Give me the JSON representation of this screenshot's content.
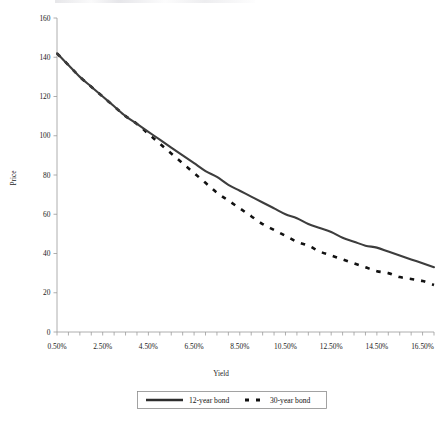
{
  "chart_data": {
    "type": "line",
    "title": "",
    "xlabel": "Yield",
    "ylabel": "Price",
    "xlim": [
      0.5,
      17.0
    ],
    "ylim": [
      0,
      160
    ],
    "grid": false,
    "legend_position": "bottom",
    "x_tick_labels": [
      "0.50%",
      "2.50%",
      "4.50%",
      "6.50%",
      "8.50%",
      "10.50%",
      "12.50%",
      "14.50%",
      "16.50%"
    ],
    "x_tick_values": [
      0.5,
      2.5,
      4.5,
      6.5,
      8.5,
      10.5,
      12.5,
      14.5,
      16.5
    ],
    "x_minor_tick_step": 0.5,
    "y_tick_labels": [
      "0",
      "20",
      "40",
      "60",
      "80",
      "100",
      "120",
      "140",
      "160"
    ],
    "y_tick_values": [
      0,
      20,
      40,
      60,
      80,
      100,
      120,
      140,
      160
    ],
    "x": [
      0.5,
      1.0,
      1.5,
      2.0,
      2.5,
      3.0,
      3.5,
      4.0,
      4.5,
      5.0,
      5.5,
      6.0,
      6.5,
      7.0,
      7.5,
      8.0,
      8.5,
      9.0,
      9.5,
      10.0,
      10.5,
      11.0,
      11.5,
      12.0,
      12.5,
      13.0,
      13.5,
      14.0,
      14.5,
      15.0,
      15.5,
      16.0,
      16.5,
      17.0
    ],
    "series": [
      {
        "name": "12-year bond",
        "style": "solid",
        "color": "#3d3d3d",
        "values": [
          142,
          136,
          130,
          125,
          120,
          115,
          110,
          106,
          102,
          98,
          94,
          90,
          86,
          82,
          79,
          75,
          72,
          69,
          66,
          63,
          60,
          58,
          55,
          53,
          51,
          48,
          46,
          44,
          43,
          41,
          39,
          37,
          35,
          33
        ]
      },
      {
        "name": "30-year bond",
        "style": "dashed",
        "color": "#111111",
        "values": [
          142,
          136,
          130,
          125,
          120,
          115,
          110,
          106,
          101,
          96,
          91,
          86,
          81,
          76,
          71,
          67,
          63,
          59,
          55,
          52,
          49,
          46,
          44,
          41,
          39,
          37,
          35,
          33,
          31,
          30,
          28,
          27,
          26,
          24
        ]
      }
    ],
    "legend": [
      {
        "label": "12-year bond",
        "style": "solid"
      },
      {
        "label": "30-year bond",
        "style": "dashed"
      }
    ]
  }
}
